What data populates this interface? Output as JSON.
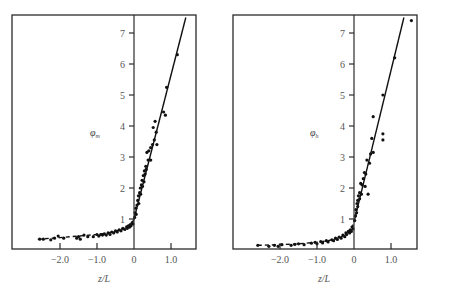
{
  "chart_data": [
    {
      "type": "scatter",
      "panel": "left",
      "title": "",
      "xlabel": "z/L",
      "ylabel": "φm",
      "ylabel_symbol": "φ",
      "ylabel_sub": "m",
      "xlim": [
        -3.3,
        1.7
      ],
      "ylim": [
        0,
        7.5
      ],
      "xticks": [
        -2.0,
        -1.0,
        0,
        1.0
      ],
      "xtick_labels": [
        "−2.0",
        "−1.0",
        "0",
        "1.0"
      ],
      "yticks": [
        1,
        2,
        3,
        4,
        5,
        6,
        7
      ],
      "ytick_labels": [
        "1",
        "2",
        "3",
        "4",
        "5",
        "6",
        "7"
      ],
      "grid": false,
      "legend": null,
      "fit_curves": {
        "stable_line": {
          "style": "solid",
          "x": [
            0,
            1.4
          ],
          "y": [
            1.0,
            7.5
          ]
        },
        "unstable_curve": {
          "style": "dashed",
          "x": [
            -2.6,
            -2.0,
            -1.5,
            -1.0,
            -0.7,
            -0.5,
            -0.3,
            -0.2,
            -0.1,
            -0.05,
            0
          ],
          "y": [
            0.35,
            0.4,
            0.45,
            0.5,
            0.55,
            0.6,
            0.68,
            0.74,
            0.82,
            0.88,
            1.0
          ]
        }
      },
      "points": [
        [
          -2.55,
          0.35
        ],
        [
          -2.45,
          0.35
        ],
        [
          -2.25,
          0.33
        ],
        [
          -2.15,
          0.38
        ],
        [
          -2.05,
          0.45
        ],
        [
          -1.9,
          0.38
        ],
        [
          -1.55,
          0.38
        ],
        [
          -1.5,
          0.43
        ],
        [
          -1.45,
          0.35
        ],
        [
          -1.35,
          0.48
        ],
        [
          -1.25,
          0.43
        ],
        [
          -1.1,
          0.43
        ],
        [
          -1.0,
          0.5
        ],
        [
          -0.95,
          0.45
        ],
        [
          -0.9,
          0.5
        ],
        [
          -0.85,
          0.48
        ],
        [
          -0.8,
          0.52
        ],
        [
          -0.75,
          0.48
        ],
        [
          -0.7,
          0.55
        ],
        [
          -0.65,
          0.5
        ],
        [
          -0.6,
          0.58
        ],
        [
          -0.55,
          0.55
        ],
        [
          -0.5,
          0.62
        ],
        [
          -0.45,
          0.58
        ],
        [
          -0.4,
          0.65
        ],
        [
          -0.35,
          0.62
        ],
        [
          -0.3,
          0.7
        ],
        [
          -0.25,
          0.66
        ],
        [
          -0.2,
          0.75
        ],
        [
          -0.18,
          0.7
        ],
        [
          -0.15,
          0.78
        ],
        [
          -0.12,
          0.74
        ],
        [
          -0.1,
          0.82
        ],
        [
          -0.08,
          0.78
        ],
        [
          -0.05,
          0.88
        ],
        [
          -0.03,
          0.84
        ],
        [
          0.02,
          1.05
        ],
        [
          0.03,
          1.2
        ],
        [
          0.05,
          1.35
        ],
        [
          0.06,
          1.15
        ],
        [
          0.08,
          1.45
        ],
        [
          0.1,
          1.6
        ],
        [
          0.12,
          1.75
        ],
        [
          0.13,
          1.5
        ],
        [
          0.15,
          1.85
        ],
        [
          0.17,
          2.0
        ],
        [
          0.18,
          1.8
        ],
        [
          0.2,
          2.1
        ],
        [
          0.22,
          2.25
        ],
        [
          0.23,
          2.05
        ],
        [
          0.25,
          2.4
        ],
        [
          0.27,
          2.2
        ],
        [
          0.28,
          2.55
        ],
        [
          0.3,
          2.45
        ],
        [
          0.32,
          2.7
        ],
        [
          0.33,
          2.6
        ],
        [
          0.35,
          3.15
        ],
        [
          0.38,
          2.9
        ],
        [
          0.4,
          3.2
        ],
        [
          0.45,
          3.3
        ],
        [
          0.45,
          2.9
        ],
        [
          0.5,
          3.4
        ],
        [
          0.52,
          3.95
        ],
        [
          0.55,
          3.55
        ],
        [
          0.57,
          4.15
        ],
        [
          0.6,
          3.8
        ],
        [
          0.62,
          3.4
        ],
        [
          0.8,
          4.45
        ],
        [
          0.85,
          4.35
        ],
        [
          0.88,
          5.25
        ],
        [
          1.17,
          6.3
        ]
      ]
    },
    {
      "type": "scatter",
      "panel": "right",
      "title": "",
      "xlabel": "z/L",
      "ylabel": "φh",
      "ylabel_symbol": "φ",
      "ylabel_sub": "h",
      "xlim": [
        -3.3,
        1.7
      ],
      "ylim": [
        0,
        7.5
      ],
      "xticks": [
        -2.0,
        -1.0,
        0,
        1.0
      ],
      "xtick_labels": [
        "−2.0",
        "−1.0",
        "0",
        "1.0"
      ],
      "yticks": [
        1,
        2,
        3,
        4,
        5,
        6,
        7
      ],
      "ytick_labels": [
        "1",
        "2",
        "3",
        "4",
        "5",
        "6",
        "7"
      ],
      "grid": false,
      "legend": null,
      "fit_curves": {
        "stable_line": {
          "style": "solid",
          "x": [
            0,
            1.35
          ],
          "y": [
            0.9,
            7.5
          ]
        },
        "unstable_curve": {
          "style": "dashed",
          "x": [
            -2.6,
            -2.0,
            -1.5,
            -1.0,
            -0.7,
            -0.5,
            -0.3,
            -0.2,
            -0.1,
            -0.05,
            0
          ],
          "y": [
            0.15,
            0.17,
            0.2,
            0.25,
            0.3,
            0.36,
            0.45,
            0.53,
            0.63,
            0.72,
            0.9
          ]
        }
      },
      "points": [
        [
          -2.6,
          0.15
        ],
        [
          -2.3,
          0.12
        ],
        [
          -2.15,
          0.15
        ],
        [
          -2.05,
          0.12
        ],
        [
          -1.95,
          0.17
        ],
        [
          -1.7,
          0.15
        ],
        [
          -1.6,
          0.18
        ],
        [
          -1.5,
          0.2
        ],
        [
          -1.35,
          0.17
        ],
        [
          -1.15,
          0.22
        ],
        [
          -1.05,
          0.25
        ],
        [
          -1.0,
          0.2
        ],
        [
          -0.9,
          0.27
        ],
        [
          -0.85,
          0.23
        ],
        [
          -0.75,
          0.3
        ],
        [
          -0.7,
          0.26
        ],
        [
          -0.6,
          0.33
        ],
        [
          -0.55,
          0.3
        ],
        [
          -0.5,
          0.38
        ],
        [
          -0.45,
          0.34
        ],
        [
          -0.4,
          0.42
        ],
        [
          -0.35,
          0.38
        ],
        [
          -0.3,
          0.48
        ],
        [
          -0.25,
          0.43
        ],
        [
          -0.22,
          0.55
        ],
        [
          -0.2,
          0.5
        ],
        [
          -0.15,
          0.6
        ],
        [
          -0.12,
          0.55
        ],
        [
          -0.1,
          0.65
        ],
        [
          -0.07,
          0.6
        ],
        [
          -0.05,
          0.75
        ],
        [
          -0.03,
          0.68
        ],
        [
          0.02,
          0.95
        ],
        [
          0.04,
          1.1
        ],
        [
          0.05,
          1.3
        ],
        [
          0.07,
          1.2
        ],
        [
          0.08,
          1.5
        ],
        [
          0.1,
          1.6
        ],
        [
          0.1,
          1.4
        ],
        [
          0.12,
          1.75
        ],
        [
          0.15,
          1.85
        ],
        [
          0.15,
          1.65
        ],
        [
          0.18,
          2.15
        ],
        [
          0.2,
          1.8
        ],
        [
          0.22,
          2.1
        ],
        [
          0.25,
          2.3
        ],
        [
          0.28,
          2.5
        ],
        [
          0.3,
          2.05
        ],
        [
          0.32,
          2.45
        ],
        [
          0.35,
          2.9
        ],
        [
          0.38,
          1.8
        ],
        [
          0.42,
          2.8
        ],
        [
          0.45,
          3.1
        ],
        [
          0.48,
          3.6
        ],
        [
          0.52,
          3.15
        ],
        [
          0.52,
          4.3
        ],
        [
          0.78,
          5.0
        ],
        [
          0.78,
          3.75
        ],
        [
          0.78,
          3.55
        ],
        [
          1.1,
          6.2
        ],
        [
          1.55,
          7.4
        ]
      ]
    }
  ],
  "panels": {
    "left": {
      "ylabel_symbol": "φ",
      "ylabel_sub": "m",
      "xlabel": "z/L",
      "ytick": [
        "1",
        "2",
        "3",
        "4",
        "5",
        "6",
        "7"
      ],
      "xtick": [
        "−2.0",
        "−1.0",
        "0",
        "1.0"
      ]
    },
    "right": {
      "ylabel_symbol": "φ",
      "ylabel_sub": "h",
      "xlabel": "z/L",
      "ytick": [
        "1",
        "2",
        "3",
        "4",
        "5",
        "6",
        "7"
      ],
      "xtick": [
        "−2.0",
        "−1.0",
        "0",
        "1.0"
      ]
    }
  }
}
